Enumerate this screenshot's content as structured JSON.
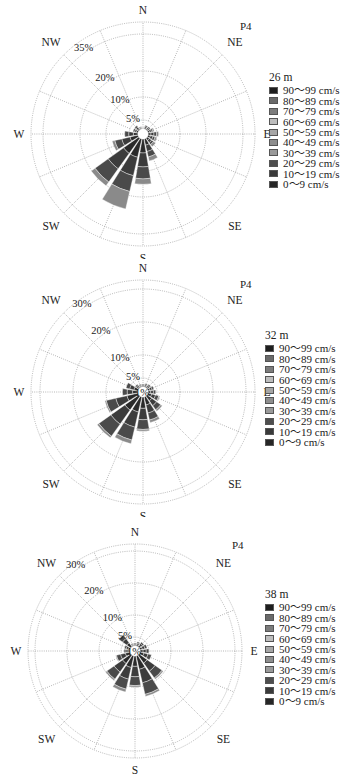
{
  "chart_data": [
    {
      "type": "windrose",
      "title": "26 m",
      "site_label": "P4",
      "directions": [
        "N",
        "NNE",
        "NE",
        "ENE",
        "E",
        "ESE",
        "SE",
        "SSE",
        "S",
        "SSW",
        "SW",
        "WSW",
        "W",
        "WNW",
        "NW",
        "NNW"
      ],
      "direction_labels": [
        "N",
        "NE",
        "E",
        "SE",
        "S",
        "SW",
        "W",
        "NW"
      ],
      "ring_labels": [
        "5%",
        "10%",
        "20%",
        "35%"
      ],
      "ring_values": [
        5,
        10,
        20,
        35
      ],
      "rmax": 42,
      "legend_title": "26 m",
      "legend": [
        "90～99 cm/s",
        "80～89 cm/s",
        "70～79 cm/s",
        "60～69 cm/s",
        "50～59 cm/s",
        "40～49 cm/s",
        "30～39 cm/s",
        "20～29 cm/s",
        "10～19 cm/s",
        "0～9 cm/s"
      ],
      "totals": [
        0.5,
        1.5,
        1.5,
        2.5,
        4,
        3.5,
        4,
        8.5,
        17,
        27,
        22,
        10,
        5,
        2,
        2,
        1
      ],
      "outer_fraction": [
        0,
        0,
        0,
        0.2,
        0.2,
        0.2,
        0.25,
        0.18,
        0.12,
        0.25,
        0.08,
        0.1,
        0,
        0,
        0,
        0
      ]
    },
    {
      "type": "windrose",
      "title": "32 m",
      "site_label": "P4",
      "directions": [
        "N",
        "NNE",
        "NE",
        "ENE",
        "E",
        "ESE",
        "SE",
        "SSE",
        "S",
        "SSW",
        "SW",
        "WSW",
        "W",
        "WNW",
        "NW",
        "NNW"
      ],
      "direction_labels": [
        "N",
        "NE",
        "E",
        "SE",
        "S",
        "SW",
        "W",
        "NW"
      ],
      "ring_labels": [
        "1%",
        "5%",
        "10%",
        "20%",
        "30%"
      ],
      "ring_values": [
        1,
        5,
        10,
        20,
        30
      ],
      "rmax": 36,
      "legend_title": "32 m",
      "legend": [
        "90～99 cm/s",
        "80～89 cm/s",
        "70～79 cm/s",
        "60～69 cm/s",
        "50～59 cm/s",
        "40～49 cm/s",
        "30～39 cm/s",
        "20～29 cm/s",
        "10～19 cm/s",
        "0～9 cm/s"
      ],
      "totals": [
        1,
        1.2,
        1.5,
        2,
        2.5,
        4,
        6,
        8.5,
        11,
        15.5,
        16.5,
        11,
        5,
        4,
        1.5,
        1
      ],
      "outer_fraction": [
        0,
        0,
        0,
        0,
        0,
        0.1,
        0.1,
        0.1,
        0.05,
        0.08,
        0.04,
        0.04,
        0,
        0,
        0,
        0
      ]
    },
    {
      "type": "windrose",
      "title": "38 m",
      "site_label": "P4",
      "directions": [
        "N",
        "NNE",
        "NE",
        "ENE",
        "E",
        "ESE",
        "SE",
        "SSE",
        "S",
        "SSW",
        "SW",
        "WSW",
        "W",
        "WNW",
        "NW",
        "NNW"
      ],
      "direction_labels": [
        "N",
        "NE",
        "E",
        "SE",
        "S",
        "SW",
        "W",
        "NW"
      ],
      "ring_labels": [
        "1%",
        "5%",
        "10%",
        "20%",
        "30%"
      ],
      "ring_values": [
        1,
        5,
        10,
        20,
        30
      ],
      "rmax": 36,
      "legend_title": "38 m",
      "legend": [
        "90～99 cm/s",
        "80～89 cm/s",
        "70～79 cm/s",
        "60～69 cm/s",
        "50～59 cm/s",
        "40～49 cm/s",
        "30～39 cm/s",
        "20～29 cm/s",
        "10～19 cm/s",
        "0～9 cm/s"
      ],
      "totals": [
        1,
        1.5,
        2,
        2.5,
        3,
        4,
        10,
        14,
        10.5,
        12.5,
        10.5,
        5,
        2,
        2,
        5,
        1
      ],
      "outer_fraction": [
        0,
        0,
        0,
        0,
        0,
        0,
        0.05,
        0.05,
        0.05,
        0.08,
        0.05,
        0.05,
        0,
        0,
        0,
        0
      ]
    }
  ],
  "legend_colors": [
    "#1e1e1e",
    "#6a6a6a",
    "#7c7c7c",
    "#bdbdbd",
    "#a6a6a6",
    "#8e8e8e",
    "#9a9a9a",
    "#4e4e4e",
    "#3a3a3a",
    "#262626"
  ],
  "charts": [
    {
      "site": "P4",
      "legend_title": "26 m"
    },
    {
      "site": "P4",
      "legend_title": "32 m"
    },
    {
      "site": "P4",
      "legend_title": "38 m"
    }
  ]
}
